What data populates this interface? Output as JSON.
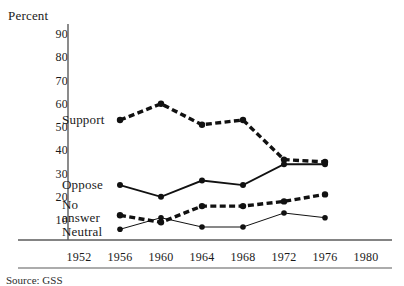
{
  "figure": {
    "y_axis_title": "Percent",
    "source_note": "Source: GSS",
    "axis_color": "#5b5b5b",
    "ink_color": "#111111"
  },
  "chart_data": {
    "type": "line",
    "title": "",
    "xlabel": "",
    "ylabel": "Percent",
    "ylim": [
      0,
      90
    ],
    "xlim": [
      1950,
      1982
    ],
    "grid": false,
    "legend": "inline-left-labels",
    "yticks": [
      90,
      80,
      70,
      60,
      50,
      40,
      30,
      20,
      10
    ],
    "categories": [
      1952,
      1956,
      1960,
      1964,
      1968,
      1972,
      1976,
      1980
    ],
    "xticks": [
      "1952",
      "1956",
      "1960",
      "1964",
      "1968",
      "1972",
      "1976",
      "1980"
    ],
    "series": [
      {
        "name": "Support",
        "label": "Support",
        "style": "thick-dashed",
        "x": [
          1956,
          1960,
          1964,
          1968,
          1972,
          1976
        ],
        "values": [
          53,
          60,
          51,
          53,
          36,
          35
        ]
      },
      {
        "name": "Oppose",
        "label": "Oppose",
        "style": "medium-solid",
        "x": [
          1956,
          1960,
          1964,
          1968,
          1972,
          1976
        ],
        "values": [
          25,
          20,
          27,
          25,
          34,
          34
        ]
      },
      {
        "name": "No answer",
        "label": "No\nanswer",
        "label_line1": "No",
        "label_line2": "answer",
        "style": "thick-dashed",
        "x": [
          1956,
          1960,
          1964,
          1968,
          1972,
          1976
        ],
        "values": [
          12,
          9,
          16,
          16,
          18,
          21
        ]
      },
      {
        "name": "Neutral",
        "label": "Neutral",
        "style": "thin-solid",
        "x": [
          1956,
          1960,
          1964,
          1968,
          1972,
          1976
        ],
        "values": [
          6,
          11,
          7,
          7,
          13,
          11
        ]
      }
    ]
  }
}
